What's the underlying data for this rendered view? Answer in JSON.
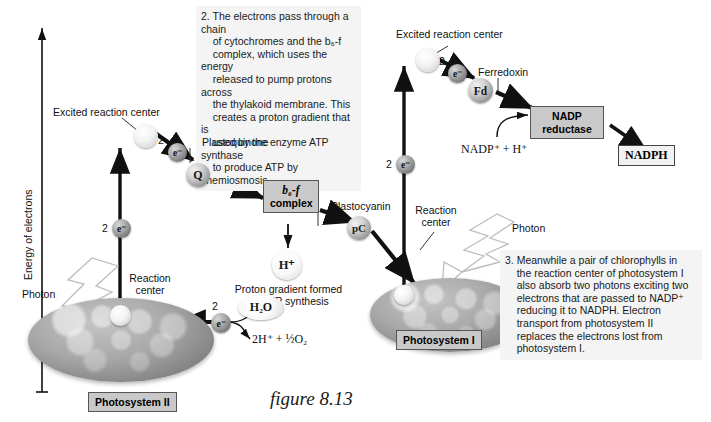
{
  "figure": {
    "caption": "figure 8.13",
    "axis_label": "Energy of electrons"
  },
  "callouts": [
    {
      "id": "step2",
      "text": "2. The electrons pass through a chain\n    of cytochromes and the b₆-f\n    complex, which uses the energy\n    released to pump protons across\n    the thylakoid membrane. This\n    creates a proton gradient that is\n    used by the enzyme ATP synthase\n    to produce ATP by chemiosmosis."
    },
    {
      "id": "step3",
      "text": "3. Meanwhile a pair of chlorophylls in\n    the reaction center of photosystem I\n    also absorb two photons exciting two\n    electrons that are passed to NADP⁺\n    reducing it to NADPH. Electron\n    transport from photosystem II\n    replaces the electrons lost from\n    photosystem I."
    }
  ],
  "photosystem_ii": {
    "name": "Photosystem II",
    "reaction_center_label": "Reaction\ncenter",
    "excited_label": "Excited reaction center",
    "photon_label": "Photon",
    "electron_count": "2",
    "electron_symbol": "e⁻",
    "water_label": "H₂O",
    "split_products": "2H⁺ + ½O₂"
  },
  "photosystem_i": {
    "name": "Photosystem I",
    "reaction_center_label": "Reaction\ncenter",
    "excited_label": "Excited reaction center",
    "photon_label": "Photon",
    "electron_count": "2",
    "electron_symbol": "e⁻"
  },
  "carriers": [
    {
      "id": "plastoquinone",
      "symbol": "Q",
      "label": "Plastoquinone"
    },
    {
      "id": "b6f",
      "symbol": "b₆-f\ncomplex",
      "label": "b₆-f complex"
    },
    {
      "id": "plastocyanin",
      "symbol": "pC",
      "label": "Plastocyanin"
    },
    {
      "id": "ferredoxin",
      "symbol": "Fd",
      "label": "Ferredoxin"
    }
  ],
  "b6f_complex": {
    "line1": "b₆-f",
    "line2": "complex"
  },
  "proton": {
    "symbol": "H⁺",
    "caption": "Proton gradient formed\nfor ATP synthesis"
  },
  "nadp": {
    "reductase_line1": "NADP",
    "reductase_line2": "reductase",
    "substrate": "NADP⁺ + H⁺",
    "product": "NADPH"
  },
  "electron_markers": {
    "chain_ps2_count": "2",
    "chain_ps1_count": "2",
    "symbol": "e⁻"
  },
  "colors": {
    "callout_bg": "#f4f4f4",
    "chip_bg": "#c9c9c9",
    "chip_border": "#555555",
    "stroke": "#111111",
    "blob_mid": "#a9a9a9"
  }
}
